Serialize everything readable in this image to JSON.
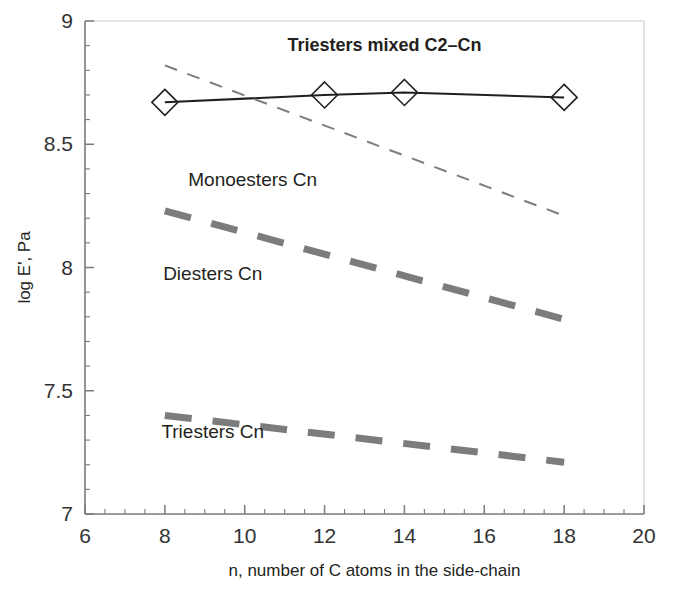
{
  "chart_data": {
    "type": "line",
    "title": "",
    "xlabel": "n, number of C atoms in the side-chain",
    "ylabel": "log E', Pa",
    "xlim": [
      6,
      20
    ],
    "ylim": [
      7,
      9
    ],
    "x_ticks": [
      6,
      8,
      10,
      12,
      14,
      16,
      18,
      20
    ],
    "x_tick_labels": [
      "6",
      "8",
      "10",
      "12",
      "14",
      "16",
      "18",
      "20"
    ],
    "y_ticks": [
      7,
      7.5,
      8,
      8.5,
      9
    ],
    "y_tick_labels": [
      "7",
      "7.5",
      "8",
      "8.5",
      "9"
    ],
    "x_minor_step": 0.5,
    "y_minor_step": 0.1,
    "grid": false,
    "legend": "inline-annotations",
    "series": [
      {
        "name": "Triesters mixed C2-Cn",
        "label": "Triesters mixed C2–Cn",
        "style": "solid-thin-with-markers",
        "marker": "open-diamond",
        "color": "#231f20",
        "x": [
          8,
          12,
          14,
          18
        ],
        "values": [
          8.67,
          8.7,
          8.71,
          8.69
        ]
      },
      {
        "name": "Monoesters Cn",
        "label": "Monoesters Cn",
        "style": "dashed-thin",
        "marker": "none",
        "color": "#7d7d7d",
        "x": [
          8,
          18
        ],
        "values": [
          8.82,
          8.21
        ]
      },
      {
        "name": "Diesters Cn",
        "label": "Diesters Cn",
        "style": "dashed-thick",
        "marker": "none",
        "color": "#7c7c7c",
        "x": [
          8,
          18
        ],
        "values": [
          8.23,
          7.79
        ]
      },
      {
        "name": "Triesters Cn",
        "label": "Triesters Cn",
        "style": "dashed-thick",
        "marker": "none",
        "color": "#7c7c7c",
        "x": [
          8,
          18
        ],
        "values": [
          7.4,
          7.21
        ]
      }
    ],
    "annotations": [
      {
        "text": "Triesters mixed C2–Cn",
        "x": 13.5,
        "y": 8.88,
        "bold": true
      },
      {
        "text": "Monoesters Cn",
        "x": 10.2,
        "y": 8.33,
        "bold": false
      },
      {
        "text": "Diesters Cn",
        "x": 9.2,
        "y": 7.95,
        "bold": false
      },
      {
        "text": "Triesters Cn",
        "x": 9.2,
        "y": 7.31,
        "bold": false
      }
    ],
    "axis_colors": {
      "axis": "#7a7a7a",
      "text": "#231f20"
    }
  }
}
